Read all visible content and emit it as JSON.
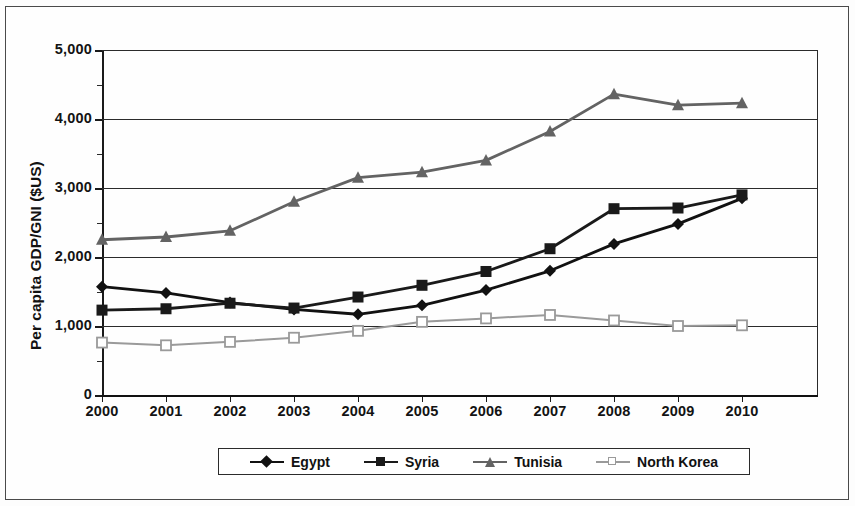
{
  "chart_data": {
    "type": "line",
    "title": "",
    "xlabel": "",
    "ylabel": "Per capita GDP/GNI ($US)",
    "x": [
      2000,
      2001,
      2002,
      2003,
      2004,
      2005,
      2006,
      2007,
      2008,
      2009,
      2010
    ],
    "xtick_labels": [
      "2000",
      "2001",
      "2002",
      "2003",
      "2004",
      "2005",
      "2006",
      "2007",
      "2008",
      "2009",
      "2010"
    ],
    "ytick_labels": [
      "0",
      "1,000",
      "2,000",
      "3,000",
      "4,000",
      "5,000"
    ],
    "ytick_values": [
      0,
      1000,
      2000,
      3000,
      4000,
      5000
    ],
    "ylim": [
      0,
      5000
    ],
    "xlim": [
      2000,
      2010
    ],
    "grid": "horizontal",
    "legend_position": "bottom",
    "series": [
      {
        "name": "Egypt",
        "marker": "filled-diamond",
        "color": "#111111",
        "values": [
          1570,
          1480,
          1340,
          1240,
          1170,
          1300,
          1520,
          1800,
          2190,
          2480,
          2850
        ]
      },
      {
        "name": "Syria",
        "marker": "filled-square",
        "color": "#1a1a1a",
        "values": [
          1230,
          1250,
          1330,
          1260,
          1420,
          1590,
          1790,
          2120,
          2700,
          2710,
          2900
        ]
      },
      {
        "name": "Tunisia",
        "marker": "filled-triangle",
        "color": "#636363",
        "values": [
          2250,
          2290,
          2380,
          2800,
          3150,
          3230,
          3400,
          3820,
          4360,
          4200,
          4230
        ]
      },
      {
        "name": "North Korea",
        "marker": "open-square",
        "color": "#9a9a9a",
        "values": [
          760,
          720,
          770,
          830,
          930,
          1060,
          1110,
          1160,
          1080,
          1000,
          1010
        ]
      }
    ]
  },
  "legend": {
    "items": [
      {
        "label": "Egypt",
        "marker": "filled-diamond"
      },
      {
        "label": "Syria",
        "marker": "filled-square"
      },
      {
        "label": "Tunisia",
        "marker": "filled-triangle"
      },
      {
        "label": "North Korea",
        "marker": "open-square"
      }
    ]
  },
  "colors": {
    "egypt": "#111111",
    "syria": "#1a1a1a",
    "tunisia": "#636363",
    "north_korea": "#9a9a9a",
    "axis": "#1a1a1a",
    "frame": "#4a4a4a"
  }
}
